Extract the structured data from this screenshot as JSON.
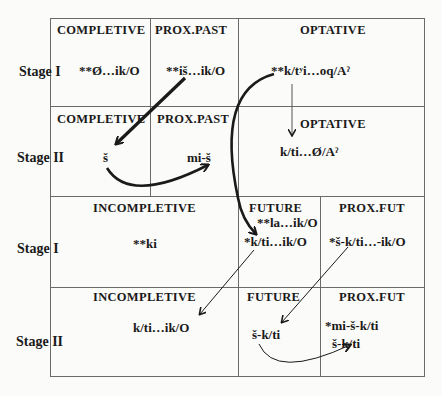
{
  "stages": {
    "row1": "Stage  I",
    "row2": "Stage  II",
    "row3": "Stage  I",
    "row4": "Stage  II"
  },
  "row1": {
    "completive": {
      "header": "COMPLETIVE",
      "form": "**Ø…ik/O"
    },
    "prox_past": {
      "header": "PROX.PAST",
      "form": "**iš…ik/O"
    },
    "optative": {
      "header": "OPTATIVE",
      "form": "**k/tʸi…oq/Aˀ"
    }
  },
  "row2": {
    "completive": {
      "header": "COMPLETIVE",
      "form": "š"
    },
    "prox_past": {
      "header": "PROX.PAST",
      "form": "mi-š"
    },
    "optative": {
      "header": "OPTATIVE",
      "form": "k/ti…Ø/Aˀ"
    }
  },
  "row3": {
    "incompletive": {
      "header": "INCOMPLETIVE",
      "form": "**ki"
    },
    "future": {
      "header": "FUTURE",
      "form1": "**la…ik/O",
      "form2": "*k/ti…ik/O"
    },
    "prox_fut": {
      "header": "PROX.FUT",
      "form": "*š-k/ti…-ik/O"
    }
  },
  "row4": {
    "incompletive": {
      "header": "INCOMPLETIVE",
      "form": "k/ti…ik/O"
    },
    "future": {
      "header": "FUTURE",
      "form": "š-k/ti"
    },
    "prox_fut": {
      "header": "PROX.FUT",
      "form1": "*mi-š-k/ti",
      "form2": "š-k/ti"
    }
  },
  "colors": {
    "line": "#6a6a6a",
    "ink": "#1a1a1a"
  }
}
